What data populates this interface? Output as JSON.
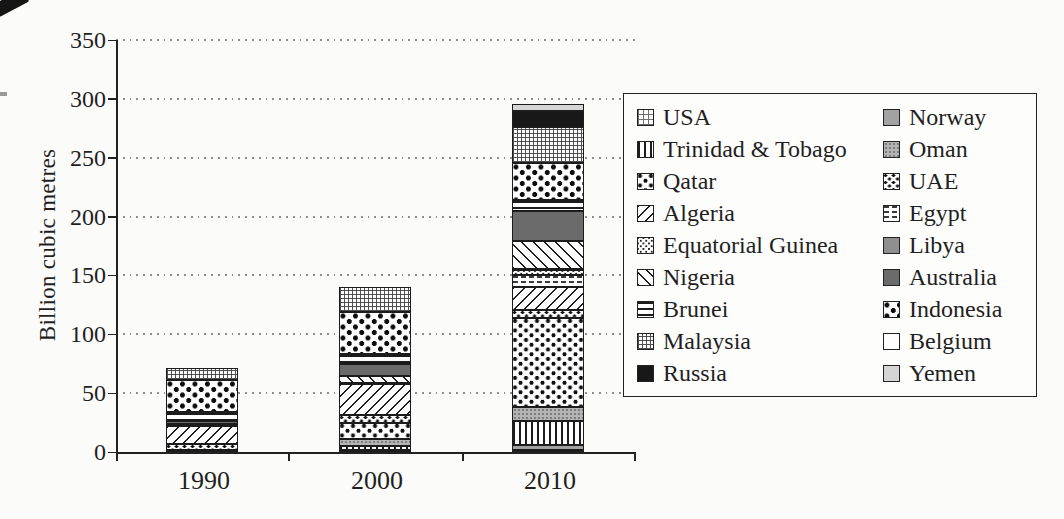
{
  "page": {
    "background": "#fbfbf9",
    "ink": "#1f1f1f"
  },
  "chart_data": {
    "type": "bar",
    "subtype": "stacked-vertical",
    "title": "",
    "xlabel": "",
    "ylabel": "Billion cubic metres",
    "categories": [
      "1990",
      "2000",
      "2010"
    ],
    "ylim": [
      0,
      350
    ],
    "ytick_step": 50,
    "y_tick_labels": [
      "0",
      "50",
      "100",
      "150",
      "200",
      "250",
      "300",
      "350"
    ],
    "grid": "horizontal-dotted",
    "legend_position": "right-box",
    "series": [
      {
        "name": "USA",
        "key": "usa",
        "pattern": "fine-grid",
        "values": [
          2,
          1.5,
          1.5
        ]
      },
      {
        "name": "Norway",
        "key": "norway",
        "pattern": "gray-solid",
        "values": [
          0,
          0,
          4.5
        ]
      },
      {
        "name": "Trinidad & Tobago",
        "key": "trinidad-tobago",
        "pattern": "vertical-lines",
        "values": [
          0,
          4,
          20.5
        ]
      },
      {
        "name": "Oman",
        "key": "oman",
        "pattern": "gray-stipple",
        "values": [
          0,
          5.5,
          11.5
        ]
      },
      {
        "name": "Qatar",
        "key": "qatar",
        "pattern": "sparse-dots",
        "values": [
          0,
          13.5,
          76
        ]
      },
      {
        "name": "UAE",
        "key": "uae",
        "pattern": "small-dots",
        "values": [
          4.5,
          7,
          7
        ]
      },
      {
        "name": "Algeria",
        "key": "algeria",
        "pattern": "diagonal-fwd",
        "values": [
          16,
          26,
          19.5
        ]
      },
      {
        "name": "Egypt",
        "key": "egypt",
        "pattern": "dash-rows",
        "values": [
          0,
          0,
          9.5
        ]
      },
      {
        "name": "Equatorial Guinea",
        "key": "equatorial-guinea",
        "pattern": "dense-stipple",
        "values": [
          0,
          0,
          5
        ]
      },
      {
        "name": "Libya",
        "key": "libya",
        "pattern": "gray-solid",
        "values": [
          1.5,
          1,
          0.5
        ]
      },
      {
        "name": "Nigeria",
        "key": "nigeria",
        "pattern": "diagonal-back",
        "values": [
          0,
          6,
          24
        ]
      },
      {
        "name": "Australia",
        "key": "australia",
        "pattern": "dark-gray-solid",
        "values": [
          2.5,
          10,
          25.5
        ]
      },
      {
        "name": "Brunei",
        "key": "brunei",
        "pattern": "horizontal-lines",
        "values": [
          7.5,
          8.5,
          9
        ]
      },
      {
        "name": "Indonesia",
        "key": "indonesia",
        "pattern": "polka-dots",
        "values": [
          27,
          36,
          31.5
        ]
      },
      {
        "name": "Malaysia",
        "key": "malaysia",
        "pattern": "dense-grid",
        "values": [
          10.5,
          21,
          30.5
        ]
      },
      {
        "name": "Belgium",
        "key": "belgium",
        "pattern": "white",
        "values": [
          0,
          0,
          0.5
        ]
      },
      {
        "name": "Russia",
        "key": "russia",
        "pattern": "black-solid",
        "values": [
          0,
          0,
          13.5
        ]
      },
      {
        "name": "Yemen",
        "key": "yemen",
        "pattern": "light-gray-solid",
        "values": [
          0,
          0,
          5.5
        ]
      }
    ],
    "totals": [
      71.5,
      140,
      295.5
    ],
    "legend": {
      "left_column": [
        "usa",
        "trinidad-tobago",
        "qatar",
        "algeria",
        "equatorial-guinea",
        "nigeria",
        "brunei",
        "malaysia",
        "russia"
      ],
      "right_column": [
        "norway",
        "oman",
        "uae",
        "egypt",
        "libya",
        "australia",
        "indonesia",
        "belgium",
        "yemen"
      ]
    }
  }
}
